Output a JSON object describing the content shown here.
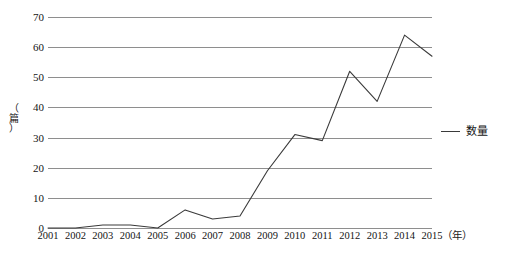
{
  "chart_data": {
    "type": "line",
    "title": "",
    "xlabel": "（年）",
    "ylabel": "（篇）",
    "categories": [
      "2001",
      "2002",
      "2003",
      "2004",
      "2005",
      "2006",
      "2007",
      "2008",
      "2009",
      "2010",
      "2011",
      "2012",
      "2013",
      "2014",
      "2015"
    ],
    "values": [
      0,
      0,
      1,
      1,
      0,
      6,
      3,
      4,
      19,
      31,
      29,
      52,
      42,
      64,
      57
    ],
    "series": [
      {
        "name": "数量",
        "values": [
          0,
          0,
          1,
          1,
          0,
          6,
          3,
          4,
          19,
          31,
          29,
          52,
          42,
          64,
          57
        ],
        "color": "#3a3a3a"
      }
    ],
    "ylim": [
      0,
      70
    ],
    "yticks": [
      0,
      10,
      20,
      30,
      40,
      50,
      60,
      70
    ],
    "ytick_labels": [
      "0",
      "10",
      "20",
      "30",
      "40",
      "50",
      "60",
      "70"
    ],
    "grid": true,
    "grid_color": "#8e8e8e",
    "legend": [
      "数量"
    ],
    "legend_position": "right"
  },
  "legend": {
    "entry_label": "数量"
  },
  "axes": {
    "y_unit_label": "（篇）",
    "y_unit_open": "（",
    "y_unit_char": "篇",
    "y_unit_close": "）",
    "x_unit_label": "（年）"
  }
}
